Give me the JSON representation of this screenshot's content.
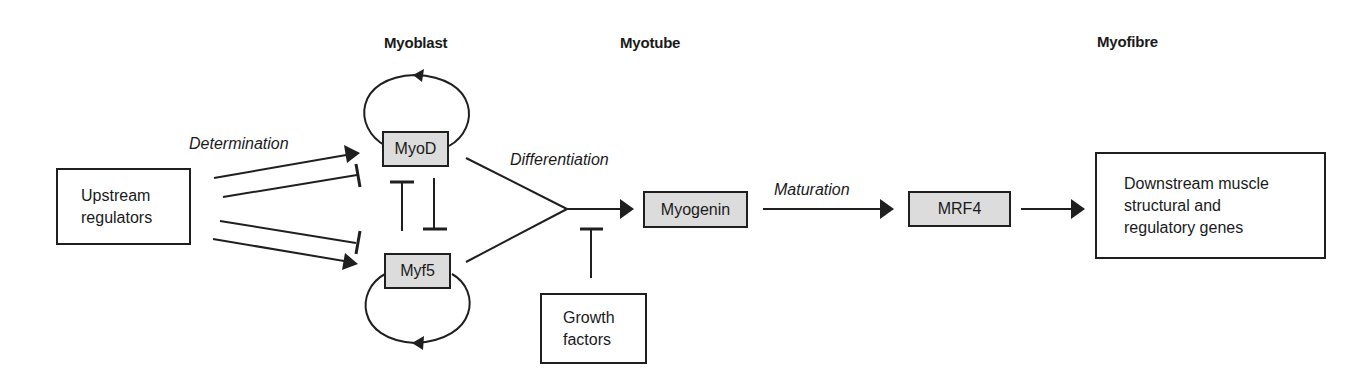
{
  "stages": {
    "myoblast": "Myoblast",
    "myotube": "Myotube",
    "myofibre": "Myofibre"
  },
  "process_labels": {
    "determination": "Determination",
    "differentiation": "Differentiation",
    "maturation": "Maturation"
  },
  "nodes": {
    "upstream": {
      "lines": [
        "Upstream",
        "regulators"
      ]
    },
    "myod": {
      "label": "MyoD"
    },
    "myf5": {
      "label": "Myf5"
    },
    "myogenin": {
      "label": "Myogenin"
    },
    "mrf4": {
      "label": "MRF4"
    },
    "growth": {
      "lines": [
        "Growth",
        "factors"
      ]
    },
    "downstream": {
      "lines": [
        "Downstream muscle",
        "structural and",
        "regulatory genes"
      ]
    }
  },
  "edges": [
    {
      "from": "upstream",
      "to": "myod",
      "type": "activation"
    },
    {
      "from": "upstream",
      "to": "myod",
      "type": "inhibition"
    },
    {
      "from": "upstream",
      "to": "myf5",
      "type": "inhibition"
    },
    {
      "from": "upstream",
      "to": "myf5",
      "type": "activation"
    },
    {
      "from": "myod",
      "to": "myod",
      "type": "auto-activation"
    },
    {
      "from": "myf5",
      "to": "myf5",
      "type": "auto-activation"
    },
    {
      "from": "myod",
      "to": "myf5",
      "type": "inhibition"
    },
    {
      "from": "myf5",
      "to": "myod",
      "type": "inhibition"
    },
    {
      "from": "myod+myf5",
      "to": "myogenin",
      "type": "activation",
      "label": "Differentiation"
    },
    {
      "from": "growth",
      "to": "differentiation",
      "type": "inhibition"
    },
    {
      "from": "myogenin",
      "to": "mrf4",
      "type": "activation",
      "label": "Maturation"
    },
    {
      "from": "mrf4",
      "to": "downstream",
      "type": "activation"
    }
  ],
  "colors": {
    "line": "#1f1f1f",
    "gene_fill": "#dcdcdc",
    "background": "#ffffff"
  }
}
